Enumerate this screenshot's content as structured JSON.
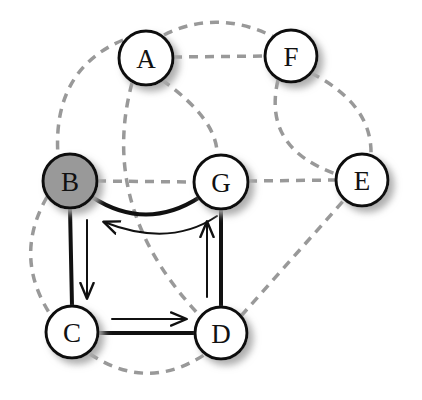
{
  "figure": {
    "name": "directed-cycle-in-graph",
    "background_color": "#ffffff",
    "width": 422,
    "height": 400
  },
  "style": {
    "node_fill_default": "#ffffff",
    "node_fill_highlight": "#999999",
    "node_stroke": "#111111",
    "node_stroke_width": 3,
    "node_radius": 27,
    "label_color": "#111111",
    "solid_edge_color": "#111111",
    "solid_edge_width": 4,
    "dashed_edge_color": "#999999",
    "dashed_edge_width": 3.5,
    "dash_pattern": "9 7",
    "arrow_color": "#111111",
    "shadow_color": "#bbbbbb"
  },
  "nodes": [
    {
      "id": "A",
      "label": "A",
      "x": 146,
      "y": 58,
      "r": 27,
      "fill": "#ffffff",
      "highlighted": false
    },
    {
      "id": "F",
      "label": "F",
      "x": 291,
      "y": 56,
      "r": 26,
      "fill": "#ffffff",
      "highlighted": false
    },
    {
      "id": "B",
      "label": "B",
      "x": 70,
      "y": 181,
      "r": 27,
      "fill": "#999999",
      "highlighted": true
    },
    {
      "id": "G",
      "label": "G",
      "x": 221,
      "y": 182,
      "r": 27,
      "fill": "#ffffff",
      "highlighted": false
    },
    {
      "id": "E",
      "label": "E",
      "x": 362,
      "y": 180,
      "r": 26,
      "fill": "#ffffff",
      "highlighted": false
    },
    {
      "id": "C",
      "label": "C",
      "x": 72,
      "y": 332,
      "r": 26,
      "fill": "#ffffff",
      "highlighted": false
    },
    {
      "id": "D",
      "label": "D",
      "x": 221,
      "y": 333,
      "r": 26,
      "fill": "#ffffff",
      "highlighted": false
    }
  ],
  "solid_edges": [
    {
      "id": "B-G",
      "from": "B",
      "to": "G",
      "style": "solid",
      "curve": "arc-down",
      "path": "M 92 197 Q 146 232 200 197"
    },
    {
      "id": "B-C",
      "from": "B",
      "to": "C",
      "style": "solid",
      "curve": "straight",
      "path": "M 70 208 L 72 306"
    },
    {
      "id": "C-D",
      "from": "C",
      "to": "D",
      "style": "solid",
      "curve": "straight",
      "path": "M 98 333 L 195 333"
    },
    {
      "id": "D-G",
      "from": "D",
      "to": "G",
      "style": "solid",
      "curve": "straight",
      "path": "M 221 307 L 221 209"
    }
  ],
  "dashed_edges": [
    {
      "id": "A-F-straight",
      "from": "A",
      "to": "F",
      "path": "M 173 57 L 265 56"
    },
    {
      "id": "A-F-arc",
      "from": "A",
      "to": "F",
      "path": "M 164 35 Q 218 8 276 38"
    },
    {
      "id": "A-B-arc",
      "from": "A",
      "to": "B",
      "path": "M 123 40 Q 52 70 58 156"
    },
    {
      "id": "A-G-arc",
      "from": "A",
      "to": "G",
      "path": "M 162 80 Q 218 120 217 155"
    },
    {
      "id": "A-D-arc",
      "from": "A",
      "to": "D",
      "path": "M 132 83 Q 98 210 202 318"
    },
    {
      "id": "B-G-straight",
      "from": "B",
      "to": "G",
      "path": "M 97 181 L 194 182"
    },
    {
      "id": "B-C-arc",
      "from": "B",
      "to": "C",
      "path": "M 47 197 Q 12 258 52 317"
    },
    {
      "id": "C-D-arc",
      "from": "C",
      "to": "D",
      "path": "M 90 354 Q 147 392 204 355"
    },
    {
      "id": "G-E-straight",
      "from": "G",
      "to": "E",
      "path": "M 248 181 L 336 180"
    },
    {
      "id": "D-E-diagonal",
      "from": "D",
      "to": "E",
      "path": "M 241 316 L 345 199"
    },
    {
      "id": "F-E-right-arc",
      "from": "F",
      "to": "E",
      "path": "M 311 73 Q 372 104 371 154"
    },
    {
      "id": "F-E-left-arc",
      "from": "F",
      "to": "E",
      "path": "M 278 80 Q 262 148 336 174"
    }
  ],
  "arrows": [
    {
      "id": "arrow-G-to-B",
      "from": "G",
      "to": "B",
      "direction": "left",
      "kind": "curved",
      "path": "M 217 216 Q 170 248 104 222",
      "label": "G to B"
    },
    {
      "id": "arrow-B-to-C",
      "from": "B",
      "to": "C",
      "direction": "down",
      "kind": "straight",
      "path": "M 87 220 L 87 298",
      "label": "B to C"
    },
    {
      "id": "arrow-C-to-D",
      "from": "C",
      "to": "D",
      "direction": "right",
      "kind": "straight",
      "path": "M 112 319 L 186 319",
      "label": "C to D"
    },
    {
      "id": "arrow-D-to-G",
      "from": "D",
      "to": "G",
      "direction": "up",
      "kind": "straight",
      "path": "M 207 297 L 207 222",
      "label": "D to G"
    }
  ],
  "cycle": {
    "sequence": [
      "B",
      "C",
      "D",
      "G",
      "B"
    ],
    "description": "Directed cycle B to C to D to G back to B"
  }
}
